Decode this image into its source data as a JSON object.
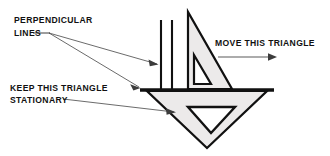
{
  "figure": {
    "background_color": "#ffffff",
    "ink_color": "#111111",
    "shape_fill_color": "#eceaea",
    "leader_color": "#5a5a5a"
  },
  "labels": {
    "perpendicular": {
      "line1": "PERPENDICULAR",
      "line2": "LINES"
    },
    "stationary": {
      "line1": "KEEP THIS TRIANGLE",
      "line2": "STATIONARY"
    },
    "move": {
      "line1": "MOVE THIS TRIANGLE"
    }
  },
  "icons": {
    "move_direction_arrow": "arrow-right-icon",
    "leader_arrow_perpendicular_upper": "leader-arrow-icon",
    "leader_arrow_perpendicular_lower": "leader-arrow-icon",
    "leader_arrow_stationary": "leader-arrow-icon"
  },
  "shapes": {
    "moving_triangle": {
      "name": "moving-triangle",
      "outer_points": "188,12 188,89 232,89",
      "inner_points": "194,55 194,84 211,84"
    },
    "stationary_triangle": {
      "name": "stationary-triangle",
      "outer_points": "147,91 267,91 207,148",
      "inner_points": "188,107 235,107 211,133"
    },
    "baseline": {
      "name": "horizontal-baseline",
      "x1": 140,
      "y1": 90,
      "x2": 274,
      "y2": 90
    },
    "perpendicular_line_1": {
      "name": "perpendicular-line-left",
      "x1": 161,
      "y1": 20,
      "x2": 161,
      "y2": 90
    },
    "perpendicular_line_2": {
      "name": "perpendicular-line-right",
      "x1": 172,
      "y1": 20,
      "x2": 172,
      "y2": 90
    },
    "move_arrow": {
      "name": "move-direction-arrow",
      "x1": 218,
      "y1": 57,
      "x2": 276,
      "y2": 57
    }
  }
}
